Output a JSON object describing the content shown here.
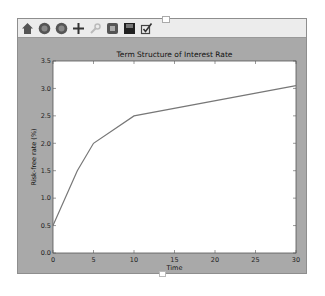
{
  "toolbar": {
    "buttons": [
      {
        "name": "home-icon",
        "label": "Home"
      },
      {
        "name": "back-icon",
        "label": "Back"
      },
      {
        "name": "forward-icon",
        "label": "Forward"
      },
      {
        "name": "pan-icon",
        "label": "Pan"
      },
      {
        "name": "zoom-icon",
        "label": "Zoom"
      },
      {
        "name": "configure-subplots-icon",
        "label": "Configure subplots"
      },
      {
        "name": "save-icon",
        "label": "Save"
      },
      {
        "name": "edit-axes-icon",
        "label": "Edit axis"
      }
    ]
  },
  "colors": {
    "figure_bg": "#a9a9a9",
    "plot_bg": "#ffffff",
    "line": "#777777",
    "toolbar_bg": "#ececec"
  },
  "chart_data": {
    "type": "line",
    "title": "Term Structure of Interest Rate",
    "xlabel": "Time",
    "ylabel": "Risk-free rate (%)",
    "x": [
      0,
      3,
      5,
      10,
      30
    ],
    "series": [
      {
        "name": "Risk-free rate",
        "values": [
          0.5,
          1.5,
          2.0,
          2.5,
          3.05
        ]
      }
    ],
    "xlim": [
      0,
      30
    ],
    "ylim": [
      0.0,
      3.5
    ],
    "xticks": [
      "0",
      "5",
      "10",
      "15",
      "20",
      "25",
      "30"
    ],
    "yticks": [
      "0.0",
      "0.5",
      "1.0",
      "1.5",
      "2.0",
      "2.5",
      "3.0",
      "3.5"
    ],
    "grid": false,
    "legend": null
  }
}
